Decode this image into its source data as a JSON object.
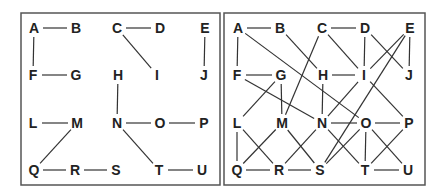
{
  "panels": [
    {
      "id": "left",
      "frame": {
        "x": 21,
        "y": 13,
        "w": 199,
        "h": 172
      },
      "nodes": [
        {
          "label": "A",
          "x": 34,
          "y": 28
        },
        {
          "label": "B",
          "x": 76,
          "y": 28
        },
        {
          "label": "C",
          "x": 117,
          "y": 28
        },
        {
          "label": "D",
          "x": 160,
          "y": 28
        },
        {
          "label": "E",
          "x": 205,
          "y": 28
        },
        {
          "label": "F",
          "x": 33,
          "y": 75
        },
        {
          "label": "G",
          "x": 76,
          "y": 75
        },
        {
          "label": "H",
          "x": 118,
          "y": 75
        },
        {
          "label": "I",
          "x": 157,
          "y": 75
        },
        {
          "label": "J",
          "x": 204,
          "y": 75
        },
        {
          "label": "L",
          "x": 33,
          "y": 123
        },
        {
          "label": "M",
          "x": 77,
          "y": 123
        },
        {
          "label": "N",
          "x": 117,
          "y": 123
        },
        {
          "label": "O",
          "x": 160,
          "y": 123
        },
        {
          "label": "P",
          "x": 204,
          "y": 123
        },
        {
          "label": "Q",
          "x": 34,
          "y": 170
        },
        {
          "label": "R",
          "x": 75,
          "y": 170
        },
        {
          "label": "S",
          "x": 116,
          "y": 170
        },
        {
          "label": "T",
          "x": 159,
          "y": 170
        },
        {
          "label": "U",
          "x": 202,
          "y": 170
        }
      ],
      "edges": [
        [
          "A",
          "B"
        ],
        [
          "C",
          "D"
        ],
        [
          "A",
          "F"
        ],
        [
          "F",
          "G"
        ],
        [
          "C",
          "I"
        ],
        [
          "E",
          "J"
        ],
        [
          "H",
          "N"
        ],
        [
          "L",
          "M"
        ],
        [
          "N",
          "O"
        ],
        [
          "O",
          "P"
        ],
        [
          "M",
          "Q"
        ],
        [
          "N",
          "T"
        ],
        [
          "Q",
          "R"
        ],
        [
          "R",
          "S"
        ],
        [
          "T",
          "U"
        ]
      ]
    },
    {
      "id": "right",
      "frame": {
        "x": 224,
        "y": 13,
        "w": 201,
        "h": 172
      },
      "nodes": [
        {
          "label": "A",
          "x": 238,
          "y": 28
        },
        {
          "label": "B",
          "x": 280,
          "y": 28
        },
        {
          "label": "C",
          "x": 322,
          "y": 28
        },
        {
          "label": "D",
          "x": 365,
          "y": 28
        },
        {
          "label": "E",
          "x": 410,
          "y": 28
        },
        {
          "label": "F",
          "x": 237,
          "y": 75
        },
        {
          "label": "G",
          "x": 281,
          "y": 75
        },
        {
          "label": "H",
          "x": 323,
          "y": 75
        },
        {
          "label": "I",
          "x": 364,
          "y": 75
        },
        {
          "label": "J",
          "x": 409,
          "y": 75
        },
        {
          "label": "L",
          "x": 237,
          "y": 123
        },
        {
          "label": "M",
          "x": 282,
          "y": 123
        },
        {
          "label": "N",
          "x": 322,
          "y": 123
        },
        {
          "label": "O",
          "x": 366,
          "y": 123
        },
        {
          "label": "P",
          "x": 409,
          "y": 123
        },
        {
          "label": "Q",
          "x": 237,
          "y": 170
        },
        {
          "label": "R",
          "x": 279,
          "y": 170
        },
        {
          "label": "S",
          "x": 320,
          "y": 170
        },
        {
          "label": "T",
          "x": 365,
          "y": 170
        },
        {
          "label": "U",
          "x": 408,
          "y": 170
        }
      ],
      "edges": [
        [
          "A",
          "B"
        ],
        [
          "C",
          "D"
        ],
        [
          "A",
          "F"
        ],
        [
          "F",
          "G"
        ],
        [
          "C",
          "I"
        ],
        [
          "D",
          "I"
        ],
        [
          "D",
          "J"
        ],
        [
          "E",
          "J"
        ],
        [
          "E",
          "I"
        ],
        [
          "E",
          "S"
        ],
        [
          "B",
          "H"
        ],
        [
          "H",
          "I"
        ],
        [
          "A",
          "O"
        ],
        [
          "C",
          "M"
        ],
        [
          "G",
          "L"
        ],
        [
          "G",
          "M"
        ],
        [
          "F",
          "N"
        ],
        [
          "H",
          "N"
        ],
        [
          "I",
          "N"
        ],
        [
          "I",
          "P"
        ],
        [
          "N",
          "O"
        ],
        [
          "O",
          "P"
        ],
        [
          "L",
          "Q"
        ],
        [
          "L",
          "R"
        ],
        [
          "M",
          "Q"
        ],
        [
          "M",
          "S"
        ],
        [
          "N",
          "R"
        ],
        [
          "N",
          "T"
        ],
        [
          "O",
          "S"
        ],
        [
          "O",
          "T"
        ],
        [
          "O",
          "U"
        ],
        [
          "P",
          "T"
        ],
        [
          "Q",
          "R"
        ],
        [
          "R",
          "S"
        ],
        [
          "T",
          "U"
        ]
      ]
    }
  ]
}
